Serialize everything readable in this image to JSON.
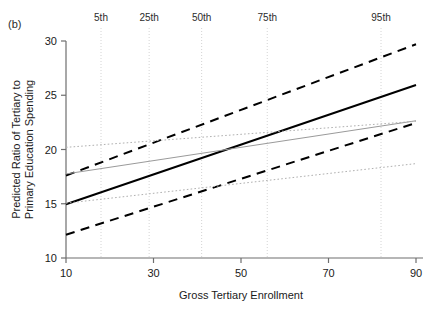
{
  "figure": {
    "panel_label": "(b)",
    "background": "#ffffff"
  },
  "chart_data": {
    "type": "line",
    "title": "",
    "xlabel": "Gross Tertiary Enrollment",
    "ylabel": "Predicted Ratio of Tertiary to Primary Education Spending",
    "xlim": [
      10,
      90
    ],
    "ylim": [
      10,
      30
    ],
    "xticks": [
      10,
      30,
      50,
      70,
      90
    ],
    "xtick_labels": [
      "10",
      "30",
      "50",
      "70",
      "90"
    ],
    "yticks": [
      10,
      15,
      20,
      25,
      30
    ],
    "ytick_labels": [
      "10",
      "15",
      "20",
      "25",
      "30"
    ],
    "grid": false,
    "legend": "none",
    "annotations": {
      "top_axis_name": "percentiles",
      "percentile_lines": [
        {
          "label": "5th",
          "x": 18
        },
        {
          "label": "25th",
          "x": 29
        },
        {
          "label": "50th",
          "x": 41
        },
        {
          "label": "75th",
          "x": 56
        },
        {
          "label": "95th",
          "x": 82
        }
      ]
    },
    "series": [
      {
        "name": "Predicted ratio (model 1 fit)",
        "style": "solid",
        "color": "#000000",
        "width": 2.0,
        "x": [
          10,
          90
        ],
        "y": [
          14.95,
          25.95
        ]
      },
      {
        "name": "Model 1 upper confidence bound",
        "style": "dashed",
        "color": "#000000",
        "width": 2.0,
        "x": [
          10,
          90
        ],
        "y": [
          17.6,
          29.7
        ]
      },
      {
        "name": "Model 1 lower confidence bound",
        "style": "dashed",
        "color": "#000000",
        "width": 2.0,
        "x": [
          10,
          90
        ],
        "y": [
          12.15,
          22.45
        ]
      },
      {
        "name": "Predicted ratio (model 2 fit)",
        "style": "solid",
        "color": "#9a9a9a",
        "width": 1.0,
        "x": [
          10,
          90
        ],
        "y": [
          17.75,
          22.65
        ]
      },
      {
        "name": "Model 2 upper confidence bound",
        "style": "dotted",
        "color": "#b0b0b0",
        "width": 1.0,
        "x": [
          10,
          90
        ],
        "y": [
          20.2,
          22.6
        ]
      },
      {
        "name": "Model 2 lower confidence bound",
        "style": "dotted",
        "color": "#b0b0b0",
        "width": 1.0,
        "x": [
          10,
          90
        ],
        "y": [
          15.05,
          18.7
        ]
      }
    ]
  }
}
